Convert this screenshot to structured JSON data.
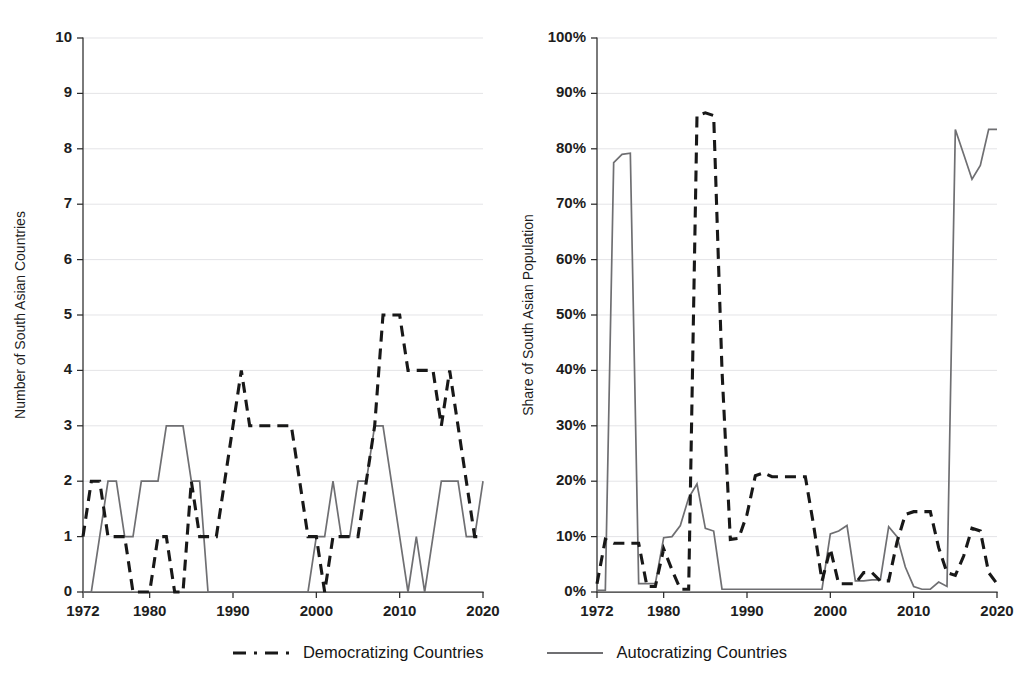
{
  "figure": {
    "background": "#ffffff",
    "series_colors": {
      "democratizing": "#181818",
      "autocratizing": "#6f6f72"
    },
    "grid_color": "#d8d8dc",
    "axis_color": "#2b2b2b"
  },
  "legend": {
    "position": "bottom-center",
    "items": [
      {
        "label": "Democratizing Countries",
        "style": "dashed",
        "color": "#181818",
        "key": "democratizing"
      },
      {
        "label": "Autocratizing Countries",
        "style": "solid",
        "color": "#6f6f72",
        "key": "autocratizing"
      }
    ]
  },
  "chart_data": [
    {
      "type": "line",
      "panel": "left",
      "title": "",
      "xlabel": "",
      "ylabel": "Number of South Asian Countries",
      "xlim": [
        1972,
        2020
      ],
      "ylim": [
        0,
        10
      ],
      "xticks": [
        1972,
        1980,
        1990,
        2000,
        2010,
        2020
      ],
      "xtick_labels": [
        "1972",
        "1980",
        "1990",
        "2000",
        "2010",
        "2020"
      ],
      "yticks": [
        0,
        1,
        2,
        3,
        4,
        5,
        6,
        7,
        8,
        9,
        10
      ],
      "ytick_labels": [
        "0",
        "1",
        "2",
        "3",
        "4",
        "5",
        "6",
        "7",
        "8",
        "9",
        "10"
      ],
      "grid": true,
      "x": [
        1972,
        1973,
        1974,
        1975,
        1976,
        1977,
        1978,
        1979,
        1980,
        1981,
        1982,
        1983,
        1984,
        1985,
        1986,
        1987,
        1988,
        1989,
        1990,
        1991,
        1992,
        1993,
        1994,
        1995,
        1996,
        1997,
        1998,
        1999,
        2000,
        2001,
        2002,
        2003,
        2004,
        2005,
        2006,
        2007,
        2008,
        2009,
        2010,
        2011,
        2012,
        2013,
        2014,
        2015,
        2016,
        2017,
        2018,
        2019,
        2020
      ],
      "series": [
        {
          "name": "Democratizing Countries",
          "key": "democratizing",
          "color": "#181818",
          "style": "dashed",
          "values": [
            1,
            2,
            2,
            1,
            1,
            1,
            0,
            0,
            0,
            1,
            1,
            0,
            0,
            2,
            1,
            1,
            1,
            2,
            3,
            4,
            3,
            3,
            3,
            3,
            3,
            3,
            2,
            1,
            1,
            0,
            1,
            1,
            1,
            1,
            2,
            3,
            5,
            5,
            5,
            4,
            4,
            4,
            4,
            3,
            4,
            3,
            2,
            1,
            1
          ]
        },
        {
          "name": "Autocratizing Countries",
          "key": "autocratizing",
          "color": "#6f6f72",
          "style": "solid",
          "values": [
            0,
            0,
            1,
            2,
            2,
            1,
            1,
            2,
            2,
            2,
            3,
            3,
            3,
            2,
            2,
            0,
            0,
            0,
            0,
            0,
            0,
            0,
            0,
            0,
            0,
            0,
            0,
            0,
            1,
            1,
            2,
            1,
            1,
            2,
            2,
            3,
            3,
            2,
            1,
            0,
            1,
            0,
            1,
            2,
            2,
            2,
            1,
            1,
            2
          ]
        }
      ]
    },
    {
      "type": "line",
      "panel": "right",
      "title": "",
      "xlabel": "",
      "ylabel": "Share of South Asian Population",
      "xlim": [
        1972,
        2020
      ],
      "ylim": [
        0,
        100
      ],
      "xticks": [
        1972,
        1980,
        1990,
        2000,
        2010,
        2020
      ],
      "xtick_labels": [
        "1972",
        "1980",
        "1990",
        "2000",
        "2010",
        "2020"
      ],
      "yticks": [
        0,
        10,
        20,
        30,
        40,
        50,
        60,
        70,
        80,
        90,
        100
      ],
      "ytick_labels": [
        "0%",
        "10%",
        "20%",
        "30%",
        "40%",
        "50%",
        "60%",
        "70%",
        "80%",
        "90%",
        "100%"
      ],
      "grid": true,
      "units": "percent",
      "x": [
        1972,
        1973,
        1974,
        1975,
        1976,
        1977,
        1978,
        1979,
        1980,
        1981,
        1982,
        1983,
        1984,
        1985,
        1986,
        1987,
        1988,
        1989,
        1990,
        1991,
        1992,
        1993,
        1994,
        1995,
        1996,
        1997,
        1998,
        1999,
        2000,
        2001,
        2002,
        2003,
        2004,
        2005,
        2006,
        2007,
        2008,
        2009,
        2010,
        2011,
        2012,
        2013,
        2014,
        2015,
        2016,
        2017,
        2018,
        2019,
        2020
      ],
      "series": [
        {
          "name": "Democratizing Countries",
          "key": "democratizing",
          "color": "#181818",
          "style": "dashed",
          "values": [
            1.5,
            9.5,
            8.8,
            8.8,
            8.8,
            8.8,
            1.0,
            1.0,
            7.8,
            4.0,
            0.5,
            0.5,
            86.0,
            86.5,
            86.0,
            40.0,
            9.5,
            9.7,
            14.0,
            21.0,
            21.5,
            20.8,
            20.8,
            20.8,
            20.8,
            20.8,
            12.0,
            2.0,
            7.8,
            1.5,
            1.5,
            1.5,
            3.5,
            3.5,
            2.0,
            2.0,
            9.0,
            14.0,
            14.5,
            14.5,
            14.5,
            8.0,
            3.5,
            3.0,
            6.5,
            11.5,
            11.0,
            3.5,
            1.5
          ]
        },
        {
          "name": "Autocratizing Countries",
          "key": "autocratizing",
          "color": "#6f6f72",
          "style": "solid",
          "values": [
            0.3,
            0.3,
            77.5,
            79.0,
            79.2,
            1.5,
            1.5,
            1.5,
            9.8,
            10.0,
            12.0,
            17.0,
            19.5,
            11.5,
            11.0,
            0.5,
            0.5,
            0.5,
            0.5,
            0.5,
            0.5,
            0.5,
            0.5,
            0.5,
            0.5,
            0.5,
            0.5,
            0.5,
            10.5,
            11.0,
            12.0,
            2.0,
            2.0,
            2.2,
            2.2,
            11.8,
            10.0,
            4.5,
            1.0,
            0.5,
            0.5,
            1.8,
            1.0,
            83.5,
            79.0,
            74.5,
            77.0,
            83.5,
            83.5
          ]
        }
      ]
    }
  ]
}
